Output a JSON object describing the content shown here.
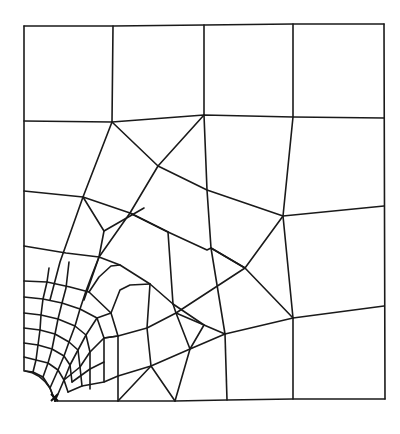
{
  "diagram": {
    "type": "finite-element-mesh",
    "stroke_color": "#1a1a1a",
    "background": "#ffffff",
    "outer_boundary": {
      "top_left": [
        24,
        26
      ],
      "top_right": [
        384,
        24
      ],
      "bottom_right": [
        385,
        399
      ],
      "bottom_left": [
        55,
        401
      ],
      "hole_arc_start": [
        25,
        371
      ]
    },
    "polylines": [
      [
        [
          24,
          26
        ],
        [
          113,
          26
        ],
        [
          204,
          25
        ],
        [
          293,
          24
        ],
        [
          384,
          24
        ]
      ],
      [
        [
          24,
          26
        ],
        [
          24,
          371
        ]
      ],
      [
        [
          384,
          24
        ],
        [
          385,
          399
        ]
      ],
      [
        [
          55,
          401
        ],
        [
          118,
          401
        ],
        [
          175,
          401
        ],
        [
          227,
          400
        ],
        [
          293,
          399
        ],
        [
          385,
          399
        ]
      ],
      [
        [
          24,
          121
        ],
        [
          112,
          122
        ],
        [
          204,
          115
        ],
        [
          293,
          117
        ],
        [
          384,
          118
        ]
      ],
      [
        [
          113,
          26
        ],
        [
          112,
          122
        ]
      ],
      [
        [
          204,
          25
        ],
        [
          204,
          115
        ]
      ],
      [
        [
          293,
          24
        ],
        [
          293,
          117
        ]
      ],
      [
        [
          112,
          122
        ],
        [
          158,
          166
        ],
        [
          207,
          190
        ],
        [
          283,
          216
        ],
        [
          384,
          206
        ]
      ],
      [
        [
          204,
          115
        ],
        [
          158,
          166
        ],
        [
          130,
          213
        ],
        [
          99,
          257
        ],
        [
          84,
          300
        ]
      ],
      [
        [
          204,
          115
        ],
        [
          207,
          190
        ],
        [
          211,
          248
        ],
        [
          225,
          334
        ]
      ],
      [
        [
          293,
          117
        ],
        [
          283,
          216
        ],
        [
          293,
          318
        ]
      ],
      [
        [
          24,
          191
        ],
        [
          83,
          197
        ],
        [
          130,
          213
        ],
        [
          168,
          232
        ]
      ],
      [
        [
          112,
          122
        ],
        [
          83,
          197
        ],
        [
          60,
          262
        ],
        [
          50,
          300
        ]
      ],
      [
        [
          83,
          197
        ],
        [
          104,
          231
        ],
        [
          99,
          257
        ]
      ],
      [
        [
          104,
          231
        ],
        [
          144,
          208
        ]
      ],
      [
        [
          24,
          246
        ],
        [
          66,
          253
        ],
        [
          99,
          257
        ],
        [
          120,
          265
        ],
        [
          150,
          284
        ],
        [
          173,
          304
        ],
        [
          204,
          325
        ],
        [
          225,
          334
        ]
      ],
      [
        [
          130,
          213
        ],
        [
          168,
          232
        ],
        [
          207,
          250
        ],
        [
          211,
          248
        ],
        [
          245,
          268
        ],
        [
          283,
          216
        ]
      ],
      [
        [
          168,
          232
        ],
        [
          173,
          304
        ]
      ],
      [
        [
          24,
          281
        ],
        [
          47,
          282
        ],
        [
          70,
          287
        ],
        [
          89,
          292
        ],
        [
          111,
          313
        ],
        [
          118,
          336
        ],
        [
          118,
          376
        ],
        [
          118,
          401
        ]
      ],
      [
        [
          24,
          297
        ],
        [
          43,
          299
        ],
        [
          62,
          303
        ],
        [
          80,
          309
        ],
        [
          97,
          318
        ],
        [
          104,
          338
        ],
        [
          104,
          362
        ],
        [
          104,
          382
        ]
      ],
      [
        [
          24,
          313
        ],
        [
          41,
          315
        ],
        [
          58,
          319
        ],
        [
          75,
          326
        ],
        [
          86,
          335
        ],
        [
          90,
          352
        ],
        [
          90,
          369
        ],
        [
          90,
          389
        ]
      ],
      [
        [
          24,
          328
        ],
        [
          40,
          330
        ],
        [
          55,
          334
        ],
        [
          69,
          342
        ],
        [
          78,
          350
        ],
        [
          80,
          367
        ],
        [
          82,
          386
        ]
      ],
      [
        [
          24,
          343
        ],
        [
          38,
          345
        ],
        [
          52,
          349
        ],
        [
          64,
          356
        ],
        [
          70,
          365
        ],
        [
          72,
          382
        ]
      ],
      [
        [
          24,
          357
        ],
        [
          36,
          360
        ],
        [
          48,
          363
        ],
        [
          58,
          370
        ],
        [
          64,
          380
        ],
        [
          68,
          392
        ]
      ],
      [
        [
          25,
          371
        ],
        [
          33,
          372
        ],
        [
          43,
          377
        ],
        [
          50,
          388
        ],
        [
          55,
          401
        ]
      ],
      [
        [
          33,
          372
        ],
        [
          36,
          360
        ],
        [
          38,
          345
        ],
        [
          40,
          330
        ],
        [
          41,
          315
        ],
        [
          43,
          299
        ],
        [
          47,
          282
        ],
        [
          49,
          268
        ]
      ],
      [
        [
          43,
          377
        ],
        [
          48,
          363
        ],
        [
          52,
          349
        ],
        [
          55,
          334
        ],
        [
          58,
          319
        ],
        [
          62,
          303
        ],
        [
          66,
          288
        ],
        [
          69,
          262
        ]
      ],
      [
        [
          50,
          388
        ],
        [
          58,
          370
        ],
        [
          64,
          356
        ],
        [
          69,
          342
        ],
        [
          75,
          326
        ],
        [
          80,
          309
        ],
        [
          86,
          291
        ],
        [
          92,
          275
        ],
        [
          99,
          257
        ]
      ],
      [
        [
          55,
          401
        ],
        [
          64,
          380
        ],
        [
          70,
          365
        ],
        [
          78,
          350
        ],
        [
          86,
          335
        ],
        [
          97,
          318
        ],
        [
          111,
          313
        ]
      ],
      [
        [
          64,
          380
        ],
        [
          80,
          367
        ],
        [
          90,
          352
        ],
        [
          104,
          338
        ],
        [
          118,
          336
        ],
        [
          147,
          328
        ],
        [
          176,
          313
        ],
        [
          204,
          325
        ]
      ],
      [
        [
          68,
          392
        ],
        [
          82,
          386
        ],
        [
          104,
          382
        ],
        [
          118,
          376
        ],
        [
          151,
          366
        ],
        [
          190,
          349
        ],
        [
          225,
          334
        ]
      ],
      [
        [
          72,
          382
        ],
        [
          90,
          369
        ],
        [
          104,
          362
        ]
      ],
      [
        [
          118,
          401
        ],
        [
          151,
          366
        ],
        [
          175,
          401
        ]
      ],
      [
        [
          151,
          366
        ],
        [
          147,
          328
        ],
        [
          150,
          284
        ]
      ],
      [
        [
          175,
          401
        ],
        [
          190,
          349
        ],
        [
          176,
          313
        ],
        [
          173,
          304
        ]
      ],
      [
        [
          227,
          400
        ],
        [
          225,
          334
        ]
      ],
      [
        [
          190,
          349
        ],
        [
          204,
          325
        ]
      ],
      [
        [
          225,
          334
        ],
        [
          293,
          318
        ],
        [
          384,
          306
        ]
      ],
      [
        [
          293,
          318
        ],
        [
          293,
          399
        ]
      ],
      [
        [
          89,
          292
        ],
        [
          99,
          277
        ],
        [
          111,
          266
        ],
        [
          120,
          265
        ]
      ],
      [
        [
          111,
          313
        ],
        [
          120,
          290
        ],
        [
          130,
          285
        ],
        [
          150,
          284
        ]
      ],
      [
        [
          104,
          338
        ],
        [
          118,
          336
        ]
      ],
      [
        [
          211,
          248
        ],
        [
          245,
          268
        ],
        [
          293,
          318
        ]
      ],
      [
        [
          176,
          313
        ],
        [
          245,
          268
        ]
      ]
    ],
    "annotations": [
      {
        "type": "boundary-condition-marker",
        "glyph": "x",
        "position": [
          55,
          399
        ]
      }
    ]
  }
}
